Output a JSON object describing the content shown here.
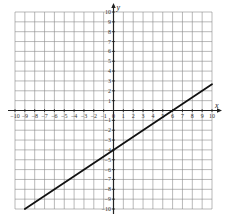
{
  "chart_data": {
    "type": "line",
    "title": "",
    "xlabel": "x",
    "ylabel": "y",
    "xlim": [
      -10,
      10
    ],
    "ylim": [
      -10,
      10
    ],
    "grid": true,
    "x_ticks": [
      -10,
      -9,
      -8,
      -7,
      -6,
      -5,
      -4,
      -3,
      -2,
      -1,
      0,
      1,
      2,
      3,
      4,
      5,
      6,
      7,
      8,
      9,
      10
    ],
    "y_ticks": [
      -10,
      -9,
      -8,
      -7,
      -6,
      -5,
      -4,
      -3,
      -2,
      -1,
      1,
      2,
      3,
      4,
      5,
      6,
      7,
      8,
      9,
      10
    ],
    "series": [
      {
        "name": "line",
        "slope": 0.6667,
        "intercept": -4,
        "x": [
          -9,
          0,
          6,
          10
        ],
        "y": [
          -10,
          -4,
          0,
          2.67
        ]
      }
    ],
    "colors": {
      "grid": "#8a8a8a",
      "axis": "#222222",
      "line": "#111111"
    }
  }
}
